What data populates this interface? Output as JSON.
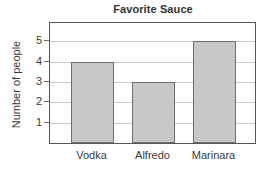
{
  "chart_data": {
    "type": "bar",
    "title": "Favorite Sauce",
    "xlabel": "",
    "ylabel": "Number of people",
    "categories": [
      "Vodka",
      "Alfredo",
      "Marinara"
    ],
    "values": [
      4,
      3,
      5
    ],
    "ylim": [
      0,
      5.9
    ],
    "yticks": [
      1,
      2,
      3,
      4,
      5
    ],
    "ytick_labels": [
      "1",
      "2",
      "3",
      "4",
      "5"
    ],
    "grid": "horizontal",
    "legend": "none",
    "colors": {
      "bar_fill": "#c8c8c8",
      "bar_edge": "#6e6e6e",
      "frame": "#555555",
      "gridline": "#c9c9c9",
      "text": "#3a3a3a",
      "background": "#ffffff"
    }
  }
}
